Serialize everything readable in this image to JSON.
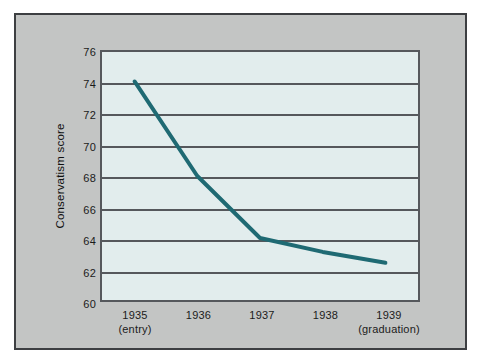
{
  "figure": {
    "background_color": "#c3c5c4",
    "border_color": "#3d3f42",
    "plot_background_color": "#e2eded",
    "grid_color": "#55585c",
    "line_color": "#1f6a73"
  },
  "axes": {
    "ylabel": "Conservatism score",
    "xlabel": "",
    "yticks": [
      "76",
      "74",
      "72",
      "70",
      "68",
      "66",
      "64",
      "62",
      "60"
    ],
    "xticks": [
      {
        "year": "1935",
        "note": "(entry)"
      },
      {
        "year": "1936",
        "note": ""
      },
      {
        "year": "1937",
        "note": ""
      },
      {
        "year": "1938",
        "note": ""
      },
      {
        "year": "1939",
        "note": "(graduation)"
      }
    ]
  },
  "chart_data": {
    "type": "line",
    "title": "",
    "xlabel": "",
    "ylabel": "Conservatism score",
    "categories": [
      "1935 (entry)",
      "1936",
      "1937",
      "1938",
      "1939 (graduation)"
    ],
    "x": [
      1935,
      1936,
      1937,
      1938,
      1939
    ],
    "values": [
      74.1,
      68.0,
      64.0,
      63.1,
      62.4
    ],
    "series": [
      {
        "name": "Conservatism score",
        "values": [
          74.1,
          68.0,
          64.0,
          63.1,
          62.4
        ]
      }
    ],
    "ylim": [
      60,
      76
    ],
    "ytick_step": 2,
    "grid": true,
    "grid_axis": "y",
    "legend": false,
    "legend_position": "none",
    "line_color": "#1f6a73",
    "line_width": 4,
    "markers": false
  }
}
